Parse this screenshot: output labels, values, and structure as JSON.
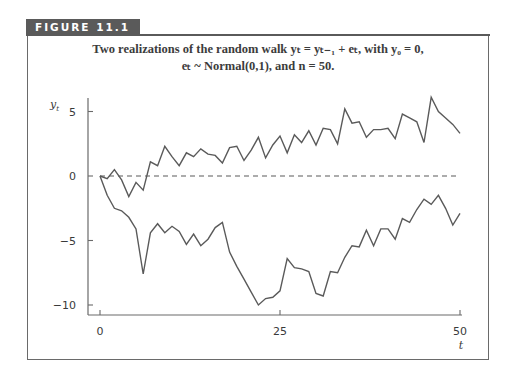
{
  "figure": {
    "label": "FIGURE 11.1",
    "caption_line1": "Two realizations of the random walk yₜ = yₜ₋₁ + eₜ, with y₀ = 0,",
    "caption_line2": "eₜ ~ Normal(0,1), and n = 50."
  },
  "colors": {
    "line": "#5a5a5a",
    "axis": "#6a6a6a",
    "label_bg": "#5a5a5a",
    "text": "#3a3a3a"
  },
  "chart_data": {
    "type": "line",
    "xlabel": "t",
    "ylabel": "y_t",
    "xlim": [
      0,
      50
    ],
    "ylim": [
      -10,
      6
    ],
    "x_ticks": [
      0,
      25,
      50
    ],
    "y_ticks": [
      5,
      0,
      -5,
      -10
    ],
    "grid": false,
    "legend": null,
    "reference_line": {
      "y": 0,
      "style": "dashed"
    },
    "x": [
      0,
      1,
      2,
      3,
      4,
      5,
      6,
      7,
      8,
      9,
      10,
      11,
      12,
      13,
      14,
      15,
      16,
      17,
      18,
      19,
      20,
      21,
      22,
      23,
      24,
      25,
      26,
      27,
      28,
      29,
      30,
      31,
      32,
      33,
      34,
      35,
      36,
      37,
      38,
      39,
      40,
      41,
      42,
      43,
      44,
      45,
      46,
      47,
      48,
      49,
      50
    ],
    "series": [
      {
        "name": "realization 1",
        "values": [
          0,
          -0.2,
          0.5,
          -0.3,
          -1.6,
          -0.5,
          -1.1,
          1.1,
          0.8,
          2.3,
          1.5,
          0.8,
          1.8,
          1.5,
          2.1,
          1.7,
          1.6,
          1.0,
          2.2,
          2.3,
          1.2,
          2.0,
          3.0,
          1.4,
          2.4,
          3.1,
          1.8,
          3.2,
          2.6,
          3.5,
          2.4,
          3.7,
          3.6,
          2.5,
          5.2,
          4.1,
          4.2,
          3.0,
          3.6,
          3.6,
          3.7,
          2.9,
          4.8,
          4.5,
          4.2,
          2.6,
          6.1,
          5.0,
          4.5,
          4.0,
          3.3
        ]
      },
      {
        "name": "realization 2",
        "values": [
          0,
          -1.5,
          -2.5,
          -2.7,
          -3.2,
          -4.1,
          -7.6,
          -4.4,
          -3.7,
          -4.4,
          -3.9,
          -4.3,
          -5.3,
          -4.5,
          -5.4,
          -4.9,
          -4.0,
          -3.6,
          -5.9,
          -7.0,
          -8.0,
          -9.0,
          -10.0,
          -9.5,
          -9.4,
          -8.9,
          -6.4,
          -7.1,
          -7.2,
          -7.4,
          -9.1,
          -9.3,
          -7.4,
          -7.5,
          -6.3,
          -5.4,
          -5.5,
          -4.2,
          -5.4,
          -4.1,
          -4.1,
          -4.9,
          -3.3,
          -3.6,
          -2.6,
          -1.8,
          -2.2,
          -1.5,
          -2.5,
          -3.8,
          -2.9
        ]
      }
    ]
  }
}
